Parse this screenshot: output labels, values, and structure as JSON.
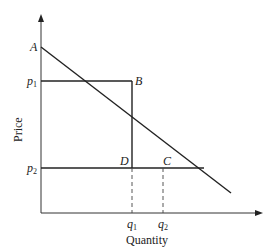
{
  "diagram": {
    "type": "supply-demand price floor diagram",
    "axes": {
      "x_label": "Quantity",
      "y_label": "Price"
    },
    "points": {
      "A": "A",
      "B": "B",
      "C": "C",
      "D": "D"
    },
    "price_levels": {
      "p1_base": "p",
      "p1_sub": "1",
      "p2_base": "p",
      "p2_sub": "2"
    },
    "quantity_levels": {
      "q1_base": "q",
      "q1_sub": "1",
      "q2_base": "q",
      "q2_sub": "2"
    },
    "colors": {
      "line": "#222222",
      "background": "#ffffff"
    }
  }
}
